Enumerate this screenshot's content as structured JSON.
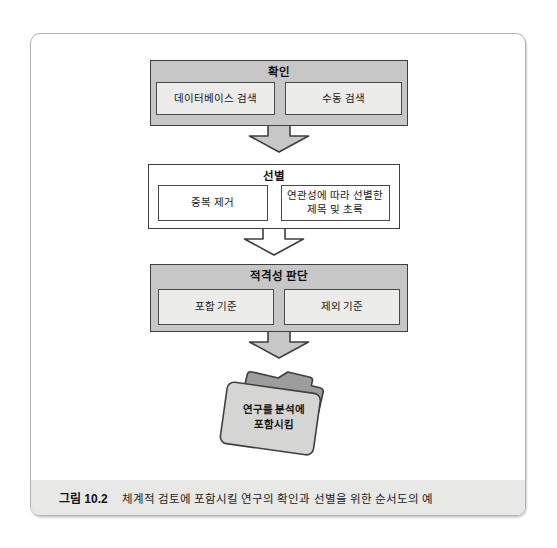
{
  "figure": {
    "caption_label": "그림 10.2",
    "caption_text": "체계적 검토에 포함시킬 연구의 확인과 선별을 위한 순서도의 예"
  },
  "flowchart": {
    "stages": [
      {
        "title": "확인",
        "items": [
          "데이터베이스 검색",
          "수동 검색"
        ]
      },
      {
        "title": "선별",
        "items": [
          "중복 제거",
          "연관성에 따라 선별한 제목 및 초록"
        ]
      },
      {
        "title": "적격성 판단",
        "items": [
          "포함 기준",
          "제외 기준"
        ]
      }
    ],
    "result": {
      "line1": "연구를 분석에",
      "line2": "포함시킴"
    }
  },
  "colors": {
    "stage_gray": "#c7c7c7",
    "inner_light": "#ececea",
    "box_border": "#3f3f3f",
    "white": "#ffffff",
    "folder_back": "#9d9d9d",
    "folder_front": "#d5d5d3",
    "caption_band": "#e8e8e6",
    "frame_border": "#b0b0b0"
  }
}
